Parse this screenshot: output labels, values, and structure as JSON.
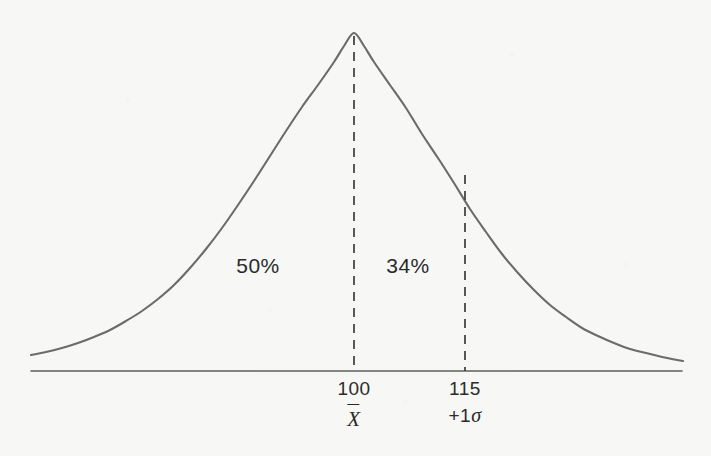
{
  "figure": {
    "kind": "normal-distribution-curve",
    "background_color": "#f7f7f5",
    "curve_color": "#6b6b6b",
    "axis_color": "#5f5f5f",
    "text_color": "#2b2b2b"
  },
  "chart_data": {
    "type": "line",
    "title": "",
    "subtitle": "",
    "xlabel": "",
    "ylabel": "",
    "grid": false,
    "legend": null,
    "distribution": {
      "name": "normal",
      "mean": 100,
      "std_dev": 15
    },
    "axis": {
      "x_pixel_start": 31,
      "x_pixel_end": 682,
      "baseline_pixel_y": 371,
      "x_domain_score_min": 55,
      "x_domain_score_max": 148
    },
    "ticks": [
      {
        "value": "100",
        "sub": "X̄",
        "sub_kind": "x-bar",
        "pixel_x": 354
      },
      {
        "value": "115",
        "sub": "+1σ",
        "sub_kind": "plus-one-sigma",
        "pixel_x": 465
      }
    ],
    "markers": [
      {
        "name": "mean-line",
        "label": "100",
        "sublabel": "X̄",
        "x": 100,
        "pixel_x": 354,
        "pixel_y_top": 36,
        "style": "dashed"
      },
      {
        "name": "plus-one-sigma-line",
        "label": "115",
        "sublabel": "+1σ",
        "x": 115,
        "pixel_x": 465,
        "pixel_y_top": 175,
        "style": "dashed"
      }
    ],
    "area_annotations": [
      {
        "label": "50%",
        "region": "left-of-mean",
        "value": 50,
        "pixel_x": 258,
        "pixel_y": 266
      },
      {
        "label": "34%",
        "region": "mean-to-plus-one-sigma",
        "value": 34,
        "pixel_x": 408,
        "pixel_y": 266
      }
    ],
    "curve_points": [
      [
        31,
        355
      ],
      [
        46,
        352
      ],
      [
        62,
        348
      ],
      [
        78,
        343
      ],
      [
        94,
        337
      ],
      [
        110,
        330
      ],
      [
        126,
        321
      ],
      [
        142,
        311
      ],
      [
        158,
        299
      ],
      [
        174,
        285
      ],
      [
        190,
        268
      ],
      [
        206,
        249
      ],
      [
        222,
        228
      ],
      [
        238,
        205
      ],
      [
        254,
        181
      ],
      [
        270,
        156
      ],
      [
        286,
        131
      ],
      [
        302,
        107
      ],
      [
        318,
        85
      ],
      [
        334,
        62
      ],
      [
        344,
        46
      ],
      [
        354,
        33
      ],
      [
        364,
        46
      ],
      [
        374,
        62
      ],
      [
        390,
        85
      ],
      [
        406,
        108
      ],
      [
        422,
        134
      ],
      [
        438,
        158
      ],
      [
        454,
        183
      ],
      [
        470,
        209
      ],
      [
        486,
        232
      ],
      [
        502,
        254
      ],
      [
        518,
        273
      ],
      [
        534,
        290
      ],
      [
        550,
        305
      ],
      [
        566,
        317
      ],
      [
        582,
        328
      ],
      [
        598,
        336
      ],
      [
        614,
        343
      ],
      [
        630,
        349
      ],
      [
        646,
        353
      ],
      [
        662,
        357
      ],
      [
        683,
        361
      ]
    ]
  },
  "labels": {
    "area_left": "50%",
    "area_right": "34%",
    "tick_mean_value": "100",
    "tick_mean_sub": "X",
    "tick_sigma_value": "115",
    "tick_sigma_sub_plus": "+1",
    "tick_sigma_sub_symbol": "σ"
  }
}
